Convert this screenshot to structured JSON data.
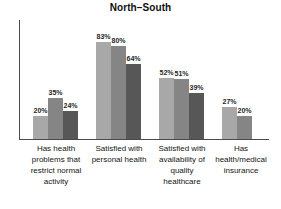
{
  "chart_data": {
    "type": "bar",
    "title": "North–South",
    "xlabel": "",
    "ylabel": "",
    "ylim": [
      0,
      100
    ],
    "grid": false,
    "legend": false,
    "value_suffix": "%",
    "categories": [
      "Has health problems that restrict normal activity",
      "Satisfied with personal health",
      "Satisfied with availability of quality healthcare",
      "Has health/medical insurance"
    ],
    "category_lines": [
      [
        "Has health",
        "problems that",
        "restrict normal",
        "activity"
      ],
      [
        "Satisfied with",
        "personal health"
      ],
      [
        "Satisfied with",
        "availability of",
        "quality",
        "healthcare"
      ],
      [
        "Has",
        "health/medical",
        "insurance"
      ]
    ],
    "series": [
      {
        "name": "Series 1",
        "color": "#a8a8a8",
        "values": [
          20,
          83,
          52,
          27
        ]
      },
      {
        "name": "Series 2",
        "color": "#858585",
        "values": [
          35,
          80,
          51,
          20
        ]
      },
      {
        "name": "Series 3",
        "color": "#575757",
        "values": [
          24,
          64,
          39,
          null
        ]
      }
    ],
    "data_labels": [
      [
        "20%",
        "35%",
        "24%"
      ],
      [
        "83%",
        "80%",
        "64%"
      ],
      [
        "52%",
        "51%",
        "39%"
      ],
      [
        "27%",
        "20%"
      ]
    ]
  },
  "axis": {
    "line_color": "#4a4a4a"
  }
}
